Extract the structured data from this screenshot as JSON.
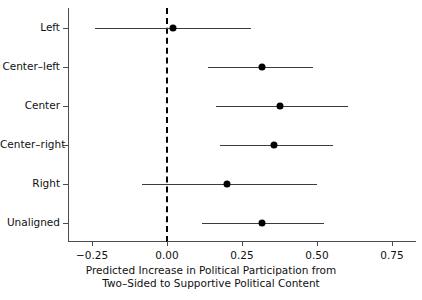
{
  "chart_data": {
    "type": "scatter",
    "title": "",
    "subtitle": "",
    "xlabel_line1": "Predicted Increase in Political Participation from",
    "xlabel_line2": "Two–Sided to Supportive Political Content",
    "ylabel": "",
    "xlim": [
      -0.33,
      0.83
    ],
    "xticks": [
      -0.25,
      0.0,
      0.25,
      0.5,
      0.75
    ],
    "xticklabels": [
      "−0.25",
      "0.00",
      "0.25",
      "0.50",
      "0.75"
    ],
    "grid": false,
    "legend": null,
    "reference_line": {
      "value": 0.0,
      "style": "dashed",
      "color": "#000000"
    },
    "categories": [
      "Left",
      "Center–left",
      "Center",
      "Center–right",
      "Right",
      "Unaligned"
    ],
    "values": [
      0.02,
      0.315,
      0.375,
      0.356,
      0.2,
      0.317
    ],
    "ci_low": [
      -0.24,
      0.138,
      0.163,
      0.176,
      -0.085,
      0.118
    ],
    "ci_high": [
      0.28,
      0.487,
      0.605,
      0.554,
      0.5,
      0.525
    ],
    "points": [
      {
        "label": "Left",
        "estimate": 0.02,
        "ci_low": -0.24,
        "ci_high": 0.28
      },
      {
        "label": "Center–left",
        "estimate": 0.315,
        "ci_low": 0.138,
        "ci_high": 0.487
      },
      {
        "label": "Center",
        "estimate": 0.375,
        "ci_low": 0.163,
        "ci_high": 0.605
      },
      {
        "label": "Center–right",
        "estimate": 0.356,
        "ci_low": 0.176,
        "ci_high": 0.554
      },
      {
        "label": "Right",
        "estimate": 0.2,
        "ci_low": -0.085,
        "ci_high": 0.5
      },
      {
        "label": "Unaligned",
        "estimate": 0.317,
        "ci_low": 0.118,
        "ci_high": 0.525
      }
    ],
    "colors": {
      "point": "#000000",
      "interval": "#3c3c3c",
      "axis": "#4d4d4d",
      "reference": "#000000",
      "background": "#ffffff"
    }
  }
}
